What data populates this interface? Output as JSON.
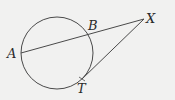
{
  "diagram": {
    "type": "circle-secant-tangent",
    "background": "#f1f1f0",
    "stroke_color": "#4a4a4a",
    "circle": {
      "cx": 57,
      "cy": 53,
      "r": 36
    },
    "points": {
      "A": {
        "x": 21,
        "y": 53,
        "label": "A"
      },
      "B": {
        "x": 90,
        "y": 34,
        "label": "B"
      },
      "X": {
        "x": 144,
        "y": 19,
        "label": "X"
      },
      "T": {
        "x": 82,
        "y": 79,
        "label": "T"
      }
    },
    "segments": [
      {
        "from": "A",
        "to": "X",
        "description": "secant through B"
      },
      {
        "from": "X",
        "to": "T",
        "description": "tangent"
      }
    ]
  }
}
